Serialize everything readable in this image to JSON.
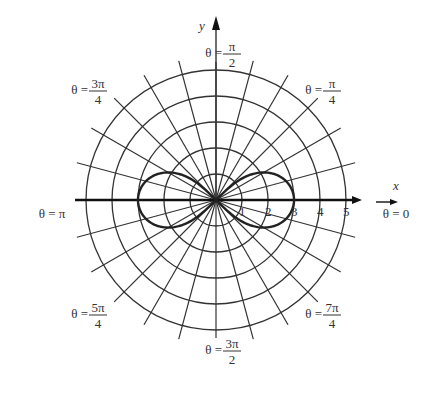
{
  "chart_data": {
    "type": "polar",
    "title": "",
    "curve": "lemniscate r^2 = 9 cos 2θ",
    "center": [
      216,
      200
    ],
    "unit_px": 26,
    "radial_ticks": [
      "1",
      "2",
      "3",
      "4",
      "5"
    ],
    "ray_step_deg": 15,
    "xlabel": "x",
    "ylabel": "y",
    "angle_labels": [
      {
        "text": "θ = 0",
        "x": 396,
        "y": 218
      },
      {
        "text": "θ = π/4",
        "x": 322,
        "y": 94
      },
      {
        "text": "θ = π/2",
        "x": 222,
        "y": 57
      },
      {
        "text": "θ = 3π/4",
        "x": 88,
        "y": 94
      },
      {
        "text": "θ = π",
        "x": 52,
        "y": 218
      },
      {
        "text": "θ = 5π/4",
        "x": 88,
        "y": 318
      },
      {
        "text": "θ = 3π/2",
        "x": 222,
        "y": 354
      },
      {
        "text": "θ = 7π/4",
        "x": 322,
        "y": 318
      }
    ]
  }
}
